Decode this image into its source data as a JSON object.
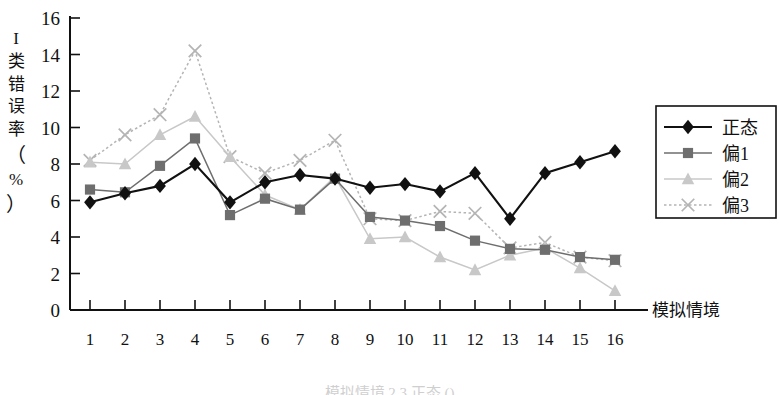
{
  "figure": {
    "y_axis_label_chars": [
      "I",
      "类",
      "错",
      "误",
      "率",
      "（",
      "%",
      "）"
    ],
    "x_axis_label": "模拟情境",
    "caption": "模拟情境 2 3 正态 ()"
  },
  "legend": {
    "position": "right",
    "entries": [
      {
        "label": "正态",
        "marker": "diamond",
        "color": "#111111",
        "line": "solid"
      },
      {
        "label": "偏1",
        "marker": "square",
        "color": "#6e6e6e",
        "line": "solid"
      },
      {
        "label": "偏2",
        "marker": "triangle",
        "color": "#c8c8c8",
        "line": "solid"
      },
      {
        "label": "偏3",
        "marker": "x",
        "color": "#b4b4b4",
        "line": "dotted"
      }
    ]
  },
  "chart_data": {
    "type": "line",
    "title": "",
    "xlabel": "模拟情境",
    "ylabel": "I 类错误率（%）",
    "xlim": [
      1,
      16
    ],
    "ylim": [
      0,
      16
    ],
    "ytick_interval": 2,
    "yticks": [
      0,
      2,
      4,
      6,
      8,
      10,
      12,
      14,
      16
    ],
    "grid": false,
    "legend_position": "right",
    "x": [
      1,
      2,
      3,
      4,
      5,
      6,
      7,
      8,
      9,
      10,
      11,
      12,
      13,
      14,
      15,
      16
    ],
    "categories": [
      "1",
      "2",
      "3",
      "4",
      "5",
      "6",
      "7",
      "8",
      "9",
      "10",
      "11",
      "12",
      "13",
      "14",
      "15",
      "16"
    ],
    "series": [
      {
        "name": "正态",
        "marker": "diamond",
        "color": "#111111",
        "values": [
          5.9,
          6.4,
          6.8,
          8.0,
          5.9,
          7.0,
          7.4,
          7.2,
          6.7,
          6.9,
          6.5,
          7.5,
          5.0,
          7.5,
          8.1,
          8.7
        ]
      },
      {
        "name": "偏1",
        "marker": "square",
        "color": "#6e6e6e",
        "values": [
          6.6,
          6.45,
          7.9,
          9.4,
          5.2,
          6.1,
          5.5,
          7.2,
          5.1,
          4.9,
          4.6,
          3.8,
          3.35,
          3.3,
          2.9,
          2.75
        ]
      },
      {
        "name": "偏2",
        "marker": "triangle",
        "color": "#c8c8c8",
        "values": [
          8.1,
          8.0,
          9.6,
          10.6,
          8.4,
          6.3,
          5.5,
          7.3,
          3.9,
          4.0,
          2.9,
          2.2,
          3.0,
          3.4,
          2.3,
          1.05
        ]
      },
      {
        "name": "偏3",
        "marker": "x",
        "color": "#b4b4b4",
        "values": [
          8.2,
          9.6,
          10.7,
          14.2,
          8.4,
          7.5,
          8.2,
          9.3,
          5.0,
          4.9,
          5.4,
          5.3,
          3.4,
          3.7,
          2.9,
          2.7
        ]
      }
    ]
  }
}
